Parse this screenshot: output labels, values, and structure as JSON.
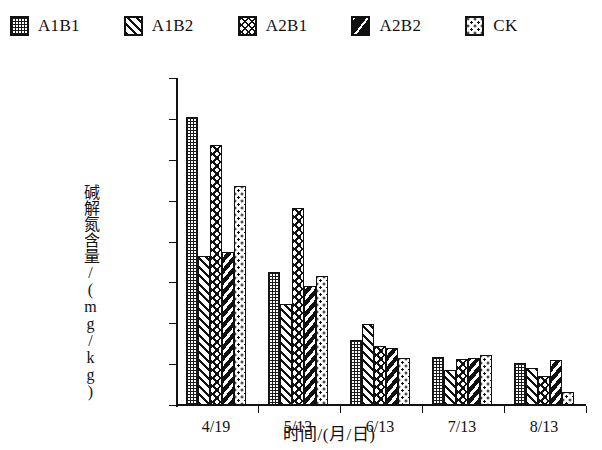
{
  "legend": {
    "items": [
      {
        "label": "A1B1",
        "pattern": "checker",
        "icon": "legend-swatch-icon"
      },
      {
        "label": "A1B2",
        "pattern": "diag",
        "icon": "legend-swatch-icon"
      },
      {
        "label": "A2B1",
        "pattern": "wave",
        "icon": "legend-swatch-icon"
      },
      {
        "label": "A2B2",
        "pattern": "heavy",
        "icon": "legend-swatch-icon"
      },
      {
        "label": "CK",
        "pattern": "dots",
        "icon": "legend-swatch-icon"
      }
    ]
  },
  "axes": {
    "y_title": "碱解氮含量/(mg/kg)",
    "x_title": "时间/(月/日)",
    "y_ticks": [
      "0.00",
      "20.00",
      "40.00",
      "60.00",
      "80.00",
      "100.00",
      "120.00",
      "140.00",
      "160.00"
    ]
  },
  "chart_data": {
    "type": "bar",
    "title": "",
    "xlabel": "时间/(月/日)",
    "ylabel": "碱解氮含量/(mg/kg)",
    "ylim": [
      0,
      160
    ],
    "ytick_step": 20,
    "grid": false,
    "legend_position": "top",
    "categories": [
      "4/19",
      "5/13",
      "6/13",
      "7/13",
      "8/13"
    ],
    "series": [
      {
        "name": "A1B1",
        "values": [
          141.0,
          65.0,
          32.0,
          23.5,
          20.5
        ]
      },
      {
        "name": "A1B2",
        "values": [
          73.0,
          49.5,
          39.5,
          17.0,
          18.0
        ]
      },
      {
        "name": "A2B1",
        "values": [
          127.0,
          96.5,
          29.0,
          22.5,
          14.0
        ]
      },
      {
        "name": "A2B2",
        "values": [
          75.0,
          58.0,
          28.0,
          23.0,
          22.0
        ]
      },
      {
        "name": "CK",
        "values": [
          107.0,
          63.0,
          23.0,
          24.5,
          6.5
        ]
      }
    ]
  }
}
